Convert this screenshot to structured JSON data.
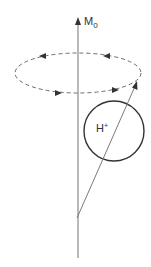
{
  "diagram": {
    "axis_label": "M",
    "axis_label_subscript": "0",
    "particle_label": "H",
    "particle_label_superscript": "+",
    "colors": {
      "axis": "#8a8a8a",
      "circle": "#333333",
      "dashed_orbit": "#6a6a6a",
      "vector": "#7a7a7a",
      "text": "#333333"
    }
  }
}
